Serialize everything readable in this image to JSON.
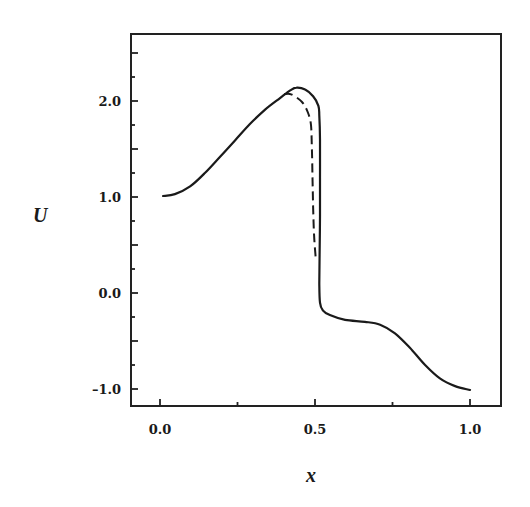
{
  "chart_data": {
    "type": "line",
    "title": "",
    "xlabel": "x",
    "ylabel": "U",
    "xlim": [
      -0.1,
      1.1
    ],
    "ylim": [
      -1.18,
      2.7
    ],
    "grid": false,
    "legend": null,
    "x_ticks": [
      {
        "value": 0.0,
        "label": "0.0",
        "major": true
      },
      {
        "value": 0.25,
        "label": "",
        "major": false
      },
      {
        "value": 0.5,
        "label": "0.5",
        "major": true
      },
      {
        "value": 0.75,
        "label": "",
        "major": false
      },
      {
        "value": 1.0,
        "label": "1.0",
        "major": true
      }
    ],
    "y_ticks": [
      {
        "value": -1.0,
        "label": "-1.0",
        "major": true
      },
      {
        "value": -0.75,
        "label": "",
        "major": false
      },
      {
        "value": -0.5,
        "label": "",
        "major": true
      },
      {
        "value": -0.25,
        "label": "",
        "major": false
      },
      {
        "value": 0.0,
        "label": "0.0",
        "major": true
      },
      {
        "value": 0.25,
        "label": "",
        "major": false
      },
      {
        "value": 0.5,
        "label": "",
        "major": true
      },
      {
        "value": 0.75,
        "label": "",
        "major": false
      },
      {
        "value": 1.0,
        "label": "1.0",
        "major": true
      },
      {
        "value": 1.25,
        "label": "",
        "major": false
      },
      {
        "value": 1.5,
        "label": "",
        "major": true
      },
      {
        "value": 1.75,
        "label": "",
        "major": false
      },
      {
        "value": 2.0,
        "label": "2.0",
        "major": true
      },
      {
        "value": 2.25,
        "label": "",
        "major": false
      },
      {
        "value": 2.5,
        "label": "",
        "major": true
      }
    ],
    "series": [
      {
        "name": "solid",
        "style": "solid",
        "x": [
          0.01,
          0.048,
          0.097,
          0.145,
          0.194,
          0.242,
          0.29,
          0.339,
          0.387,
          0.42,
          0.44,
          0.468,
          0.494,
          0.511,
          0.514,
          0.516,
          0.516,
          0.516,
          0.515,
          0.514,
          0.516,
          0.525,
          0.548,
          0.597,
          0.661,
          0.71,
          0.758,
          0.806,
          0.855,
          0.903,
          0.952,
          1.0
        ],
        "y": [
          1.01,
          1.03,
          1.11,
          1.25,
          1.42,
          1.59,
          1.76,
          1.91,
          2.03,
          2.11,
          2.14,
          2.12,
          2.05,
          1.95,
          1.85,
          1.6,
          1.2,
          0.8,
          0.4,
          0.1,
          -0.1,
          -0.18,
          -0.23,
          -0.28,
          -0.3,
          -0.33,
          -0.42,
          -0.57,
          -0.75,
          -0.89,
          -0.97,
          -1.01
        ]
      },
      {
        "name": "dashed",
        "style": "dashed",
        "x": [
          0.4,
          0.423,
          0.458,
          0.477,
          0.487,
          0.49,
          0.492,
          0.494,
          0.497,
          0.503
        ],
        "y": [
          2.07,
          2.07,
          1.99,
          1.88,
          1.75,
          1.5,
          1.2,
          0.9,
          0.6,
          0.34
        ]
      }
    ]
  },
  "axes": {
    "xlabel": "x",
    "ylabel": "U",
    "x_tick_labels": [
      "0.0",
      "0.5",
      "1.0"
    ],
    "y_tick_labels": [
      "2.0",
      "1.0",
      "0.0",
      "-1.0"
    ]
  }
}
